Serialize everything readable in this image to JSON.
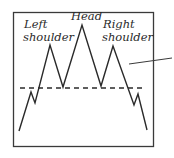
{
  "diagram": {
    "type": "head-and-shoulders-pattern",
    "labels": {
      "left_shoulder_line1": "Left",
      "left_shoulder_line2": "shoulder",
      "head": "Head",
      "right_shoulder_line1": "Right",
      "right_shoulder_line2": "shoulder"
    },
    "colors": {
      "stroke": "#2a2a2a",
      "frame": "#3a3a3a",
      "background": "#ffffff"
    }
  }
}
